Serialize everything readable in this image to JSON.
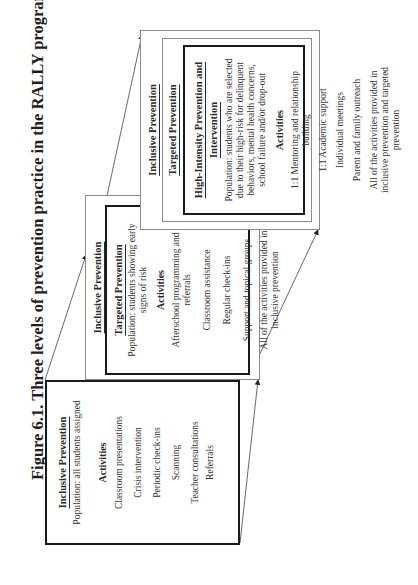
{
  "figure": {
    "title": "Figure 6.1.  Three levels of prevention practice in the RALLY program"
  },
  "levels": [
    {
      "name": "Inclusive Prevention",
      "population": "Population: all students assigned",
      "activities_heading": "Activities",
      "activities": [
        "Classroom presentations",
        "Crisis intervention",
        "Periodic check-ins",
        "Scanning",
        "Teacher consultations",
        "Referrals"
      ]
    },
    {
      "outer_label": "Inclusive Prevention",
      "name": "Targeted Prevention",
      "population": "Population: students showing early signs of risk",
      "activities_heading": "Activities",
      "activities": [
        "Afterschool programming and referrals",
        "Classroom assistance",
        "Regular check-ins",
        "Support and topical groups",
        "All of the activities provided in inclusive prevention"
      ]
    },
    {
      "outer_label": "Inclusive Prevention",
      "middle_label": "Targeted Prevention",
      "name": "High-Intensity Prevention and Intervention",
      "population": "Population: students who are selected due to their high-risk for delinquent behaviors, mental health concerns, school failure and/or drop-out",
      "activities_heading": "Activities",
      "activities": [
        "1:1 Mentoring and relationship building",
        "1:1 Academic support",
        "Individual meetings",
        "Parent and family outreach",
        "All of the activities provided in inclusive prevention and targeted prevention"
      ]
    }
  ]
}
